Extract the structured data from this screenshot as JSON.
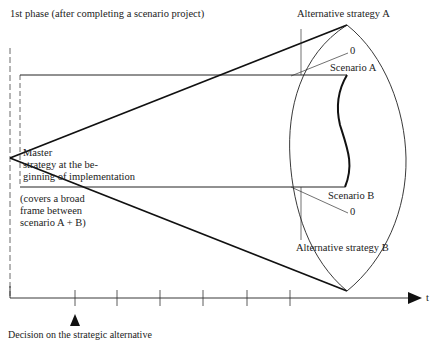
{
  "title": "1st phase (after completing a scenario project)",
  "labels": {
    "alt_a": "Alternative strategy A",
    "alt_b": "Alternative strategy B",
    "scenario_a": "Scenario A",
    "scenario_b": "Scenario B",
    "zero_a": "0",
    "zero_b": "0",
    "master_line1": "Master",
    "master_line2": "strategy at the be-",
    "master_line3": "ginning of implementation",
    "covers_line1": "(covers a broad",
    "covers_line2": "frame between",
    "covers_line3": "scenario A + B)",
    "time_axis": "t",
    "bottom_caption": "Decision on the strategic alternative"
  },
  "axis": {
    "tick_count": 6,
    "marker": "start-of-implementation-arrow"
  },
  "colors": {
    "ink": "#222222",
    "background": "#ffffff"
  }
}
